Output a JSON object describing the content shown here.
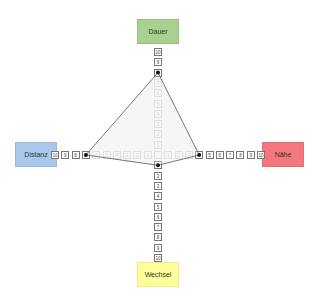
{
  "axes": {
    "top": {
      "label": "Dauer",
      "color": "#a9d08e",
      "value": 8
    },
    "right": {
      "label": "Nähe",
      "color": "#f4777d",
      "value": 4
    },
    "bottom": {
      "label": "Wechsel",
      "color": "#ffff99",
      "value": 1
    },
    "left": {
      "label": "Distanz",
      "color": "#a8c8ec",
      "value": 7
    }
  },
  "scale": [
    "1",
    "2",
    "3",
    "4",
    "5",
    "6",
    "7",
    "8",
    "9",
    "10"
  ]
}
